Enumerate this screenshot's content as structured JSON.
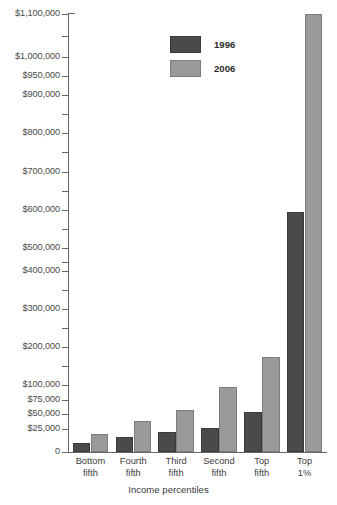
{
  "chart_data": {
    "type": "bar",
    "title": "",
    "subtitle": "",
    "xlabel": "Income percentiles",
    "ylabel": "",
    "grid": false,
    "legend_position": "top-center",
    "axis_scale": "piecewise-linear (expanded below $100,000)",
    "categories": [
      {
        "line1": "Bottom",
        "line2": "fifth"
      },
      {
        "line1": "Fourth",
        "line2": "fifth"
      },
      {
        "line1": "Third",
        "line2": "fifth"
      },
      {
        "line1": "Second",
        "line2": "fifth"
      },
      {
        "line1": "Top",
        "line2": "fifth"
      },
      {
        "line1": "Top",
        "line2": "1%"
      }
    ],
    "series": [
      {
        "name": "1996",
        "color": "#4a4a4a",
        "values": [
          10000,
          16000,
          22000,
          27000,
          54000,
          595000
        ]
      },
      {
        "name": "2006",
        "color": "#9a9a9a",
        "values": [
          20000,
          38000,
          57000,
          97000,
          175000,
          1100000
        ]
      }
    ],
    "yticks": [
      {
        "value": 1100000,
        "label": "$1,100,000",
        "y": 14,
        "labeled": true
      },
      {
        "value": 1050000,
        "label": "",
        "y": 36,
        "labeled": false
      },
      {
        "value": 1000000,
        "label": "$1,000,000",
        "y": 57,
        "labeled": true
      },
      {
        "value": 950000,
        "label": "$950,000",
        "y": 76,
        "labeled": true
      },
      {
        "value": 900000,
        "label": "$900,000",
        "y": 95,
        "labeled": true
      },
      {
        "value": 850000,
        "label": "",
        "y": 114,
        "labeled": false
      },
      {
        "value": 800000,
        "label": "$800,000",
        "y": 133,
        "labeled": true
      },
      {
        "value": 750000,
        "label": "",
        "y": 152,
        "labeled": false
      },
      {
        "value": 700000,
        "label": "$700,000",
        "y": 172,
        "labeled": true
      },
      {
        "value": 650000,
        "label": "",
        "y": 191,
        "labeled": false
      },
      {
        "value": 600000,
        "label": "$600,000",
        "y": 210,
        "labeled": true
      },
      {
        "value": 550000,
        "label": "",
        "y": 229,
        "labeled": false
      },
      {
        "value": 500000,
        "label": "$500,000",
        "y": 248,
        "labeled": true
      },
      {
        "value": 450000,
        "label": "",
        "y": 262,
        "labeled": false
      },
      {
        "value": 400000,
        "label": "$400,000",
        "y": 271,
        "labeled": true
      },
      {
        "value": 350000,
        "label": "",
        "y": 290,
        "labeled": false
      },
      {
        "value": 300000,
        "label": "$300,000",
        "y": 309,
        "labeled": true
      },
      {
        "value": 250000,
        "label": "",
        "y": 328,
        "labeled": false
      },
      {
        "value": 200000,
        "label": "$200,000",
        "y": 347,
        "labeled": true
      },
      {
        "value": 150000,
        "label": "",
        "y": 366,
        "labeled": false
      },
      {
        "value": 100000,
        "label": "$100,000",
        "y": 385,
        "labeled": true
      },
      {
        "value": 75000,
        "label": "$75,000",
        "y": 400,
        "labeled": true
      },
      {
        "value": 50000,
        "label": "$50,000",
        "y": 414,
        "labeled": true
      },
      {
        "value": 25000,
        "label": "$25,000",
        "y": 429,
        "labeled": true
      },
      {
        "value": 0,
        "label": "0",
        "y": 452,
        "labeled": true
      }
    ],
    "ylim": [
      0,
      1100000
    ]
  },
  "legend": {
    "entries": [
      {
        "label": "1996",
        "color": "#4a4a4a"
      },
      {
        "label": "2006",
        "color": "#9a9a9a"
      }
    ]
  }
}
